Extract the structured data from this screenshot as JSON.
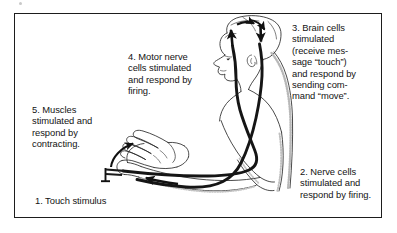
{
  "figure": {
    "frame_color": "#1d1d1d",
    "background_color": "#ffffff",
    "nerve_line_color": "#1a1a1a",
    "body_outline_color": "#2b2b2b",
    "shading_color": "#b5b5b5"
  },
  "captions": {
    "step1": "1. Touch stimulus",
    "step2": "2. Nerve cells\nstimulated and\nrespond by firing.",
    "step3": "3. Brain cells\nstimulated\n(receive mes-\nsage “touch”)\nand respond by\nsending com-\nmand “move”.",
    "step4": "4. Motor nerve\ncells stimulated\nand respond by\nfiring.",
    "step5": "5. Muscles\nstimulated and\nrespond by\ncontracting."
  },
  "icons": {
    "stimulus_marker": "pin-marker-icon",
    "muscle_arrow": "curved-up-arrow-icon",
    "sensory_arrow": "left-pointing-arrow-icon",
    "brain_in_arrow": "up-arrow-icon",
    "brain_across_arrows": "curved-arrow-pair-icon",
    "brain_out_arrow": "down-arrow-icon",
    "human_figure": "human-head-torso-arm-icon",
    "hand": "open-hand-icon"
  },
  "diagram_elements": {
    "pathways": [
      {
        "name": "sensory-nerve-pathway",
        "direction": "hand-to-brain"
      },
      {
        "name": "motor-nerve-pathway",
        "direction": "brain-to-hand"
      }
    ]
  }
}
